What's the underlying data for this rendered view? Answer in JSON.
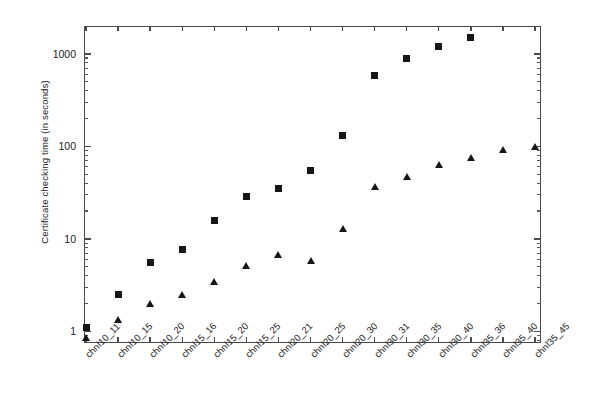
{
  "chart_data": {
    "type": "scatter",
    "title": "",
    "xlabel": "",
    "ylabel": "Certificate checking time (in seconds)",
    "yscale": "log",
    "ylim": [
      0.75,
      2000
    ],
    "ytick_labels": [
      "1",
      "10",
      "100",
      "1000"
    ],
    "ytick_values": [
      1,
      10,
      100,
      1000
    ],
    "grid": false,
    "legend": "none",
    "categories": [
      "chnl10_11",
      "chnl10_15",
      "chnl10_20",
      "chnl15_16",
      "chnl15_20",
      "chnl15_25",
      "chnl20_21",
      "chnl20_25",
      "chnl20_30",
      "chnl30_31",
      "chnl30_35",
      "chnl30_40",
      "chnl35_36",
      "chnl35_40",
      "chnl35_45"
    ],
    "series": [
      {
        "name": "square-series",
        "marker": "filled-square",
        "color": "#161616",
        "values": [
          1.1,
          2.5,
          5.5,
          7.6,
          16,
          29,
          35,
          55,
          130,
          580,
          880,
          1200,
          1500,
          null,
          null
        ]
      },
      {
        "name": "triangle-series",
        "marker": "filled-triangle",
        "color": "#161616",
        "values": [
          0.85,
          1.35,
          2.0,
          2.5,
          3.5,
          5.2,
          6.8,
          5.8,
          13,
          37,
          47,
          63,
          75,
          92,
          100
        ]
      }
    ]
  },
  "axis": {
    "y_title": "Certificate checking time (in seconds)"
  }
}
